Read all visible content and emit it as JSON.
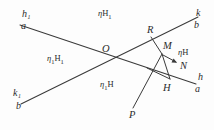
{
  "figure": {
    "stroke_color": "#3a3a3a",
    "background_color": "#fdfdfd",
    "width": 214,
    "height": 130
  },
  "points": [
    {
      "id": "O",
      "label": "O",
      "x": 104,
      "y": 55,
      "role": "intersection-of-a-and-b"
    },
    {
      "id": "R",
      "label": "R",
      "x": 150,
      "y": 34,
      "role": "point-on-line-b"
    },
    {
      "id": "M",
      "label": "M",
      "x": 163,
      "y": 49,
      "role": "apex-point"
    },
    {
      "id": "H",
      "label": "H",
      "x": 165,
      "y": 80,
      "role": "foot-point-on-line-a"
    },
    {
      "id": "N",
      "label": "N",
      "x": 179,
      "y": 63,
      "role": "arrow-target"
    },
    {
      "id": "P",
      "label": "P",
      "x": 131,
      "y": 113,
      "role": "ray-endpoint"
    }
  ],
  "endpoints": {
    "top_left": {
      "line": "h₁",
      "point": "a"
    },
    "bottom_left": {
      "line": "k₁",
      "point": "b"
    },
    "top_right": {
      "line": "k",
      "point": "b"
    },
    "bottom_right": {
      "line": "h",
      "point": "a"
    }
  },
  "plane_labels": {
    "top": {
      "greek": "η",
      "sub1": "",
      "plane": "H",
      "sub2": "1",
      "text": "ηH₁"
    },
    "left": {
      "greek": "η",
      "sub1": "1",
      "plane": "H",
      "sub2": "1",
      "text": "η₁H₁"
    },
    "bottom": {
      "greek": "η",
      "sub1": "1",
      "plane": "H",
      "sub2": "",
      "text": "η₁H"
    },
    "right": {
      "greek": "η",
      "sub1": "",
      "plane": "H",
      "sub2": "",
      "text": "ηH"
    }
  },
  "segments": [
    {
      "name": "line-a",
      "from": [
        20,
        25
      ],
      "to": [
        196,
        84
      ],
      "desc": "descending line a from h1 to h"
    },
    {
      "name": "line-b",
      "from": [
        22,
        104
      ],
      "to": [
        197,
        18
      ],
      "desc": "ascending line b from k1 to k"
    },
    {
      "name": "segment-R-M",
      "from": [
        150,
        38
      ],
      "to": [
        162,
        54
      ],
      "desc": "R to M"
    },
    {
      "name": "segment-M-H",
      "from": [
        162,
        54
      ],
      "to": [
        170,
        80
      ],
      "desc": "M to H"
    },
    {
      "name": "segment-M-P",
      "from": [
        162,
        54
      ],
      "to": [
        133,
        108
      ],
      "desc": "M through to P"
    },
    {
      "name": "segment-M-N-arrow",
      "from": [
        162,
        54
      ],
      "to": [
        176,
        62
      ],
      "desc": "arrow from M toward N"
    },
    {
      "name": "segment-H-to-left",
      "from": [
        170,
        80
      ],
      "to": [
        148,
        70
      ],
      "desc": "short segment from H"
    }
  ]
}
